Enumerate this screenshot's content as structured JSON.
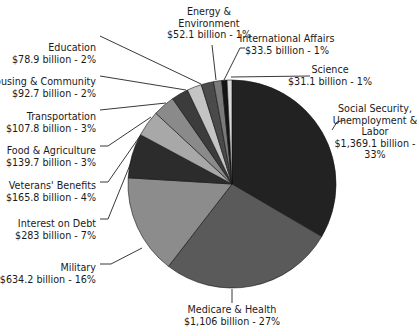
{
  "chart_data": {
    "type": "pie",
    "title": "",
    "unit": "billion",
    "start_angle_deg": 0,
    "direction": "clockwise",
    "slices": [
      {
        "label": [
          "Social Security,",
          "Unemployment &",
          "Labor",
          "$1,369.1 billion -",
          "33%"
        ],
        "name": "Social Security, Unemployment & Labor",
        "value": 1369.1,
        "percent": 33,
        "color": "#222222"
      },
      {
        "label": [
          "Medicare & Health",
          "$1,106 billion - 27%"
        ],
        "name": "Medicare & Health",
        "value": 1106,
        "percent": 27,
        "color": "#5a5a5a"
      },
      {
        "label": [
          "Military",
          "$634.2 billion - 16%"
        ],
        "name": "Military",
        "value": 634.2,
        "percent": 16,
        "color": "#8c8c8c"
      },
      {
        "label": [
          "Interest on Debt",
          "$283 billion - 7%"
        ],
        "name": "Interest on Debt",
        "value": 283,
        "percent": 7,
        "color": "#2c2c2c"
      },
      {
        "label": [
          "Veterans' Benefits",
          "$165.8 billion - 4%"
        ],
        "name": "Veterans' Benefits",
        "value": 165.8,
        "percent": 4,
        "color": "#a8a8a8"
      },
      {
        "label": [
          "Food & Agriculture",
          "$139.7 billion - 3%"
        ],
        "name": "Food & Agriculture",
        "value": 139.7,
        "percent": 3,
        "color": "#8a8a8a"
      },
      {
        "label": [
          "Transportation",
          "$107.8 billion - 3%"
        ],
        "name": "Transportation",
        "value": 107.8,
        "percent": 3,
        "color": "#3c3c3c"
      },
      {
        "label": [
          "Housing & Community",
          "$92.7 billion - 2%"
        ],
        "name": "Housing & Community",
        "value": 92.7,
        "percent": 2,
        "color": "#c4c4c4"
      },
      {
        "label": [
          "Education",
          "$78.9 billion - 2%"
        ],
        "name": "Education",
        "value": 78.9,
        "percent": 2,
        "color": "#4a4a4a"
      },
      {
        "label": [
          "Energy &",
          "Environment",
          "$52.1 billion - 1%"
        ],
        "name": "Energy & Environment",
        "value": 52.1,
        "percent": 1,
        "color": "#7a7a7a"
      },
      {
        "label": [
          "International Affairs",
          "$33.5 billion - 1%"
        ],
        "name": "International Affairs",
        "value": 33.5,
        "percent": 1,
        "color": "#151515"
      },
      {
        "label": [
          "Science",
          "$31.1 billion - 1%"
        ],
        "name": "Science",
        "value": 31.1,
        "percent": 1,
        "color": "#d8d8d8"
      }
    ]
  }
}
